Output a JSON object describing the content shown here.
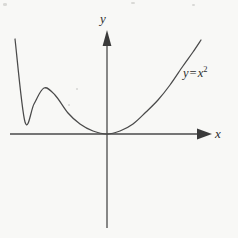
{
  "figure": {
    "background_color": "#f8f8f6",
    "ink_color": "#4a4a4a",
    "text_color": "#2e2e2e"
  },
  "labels": {
    "y_axis": "y",
    "x_axis": "x",
    "curve_lhs": "y",
    "curve_operator": "=",
    "curve_base": "x",
    "curve_exponent": "2"
  },
  "chart_data": {
    "type": "line",
    "title": "",
    "subtitle": "",
    "xlabel": "x",
    "ylabel": "y",
    "annotations": [
      "y = x²"
    ],
    "legend": [],
    "legend_position": "none",
    "grid": false,
    "axes": {
      "origin_px": [
        107,
        134
      ],
      "x_axis_from_px": [
        10,
        134
      ],
      "x_axis_to_px": [
        212,
        134
      ],
      "y_axis_from_px": [
        107,
        30
      ],
      "y_axis_to_px": [
        107,
        228
      ],
      "x_arrow": "right",
      "y_arrow": "up",
      "ticks": [],
      "tick_labels": []
    },
    "series": [
      {
        "name": "y = x²",
        "equation": "y = x^2",
        "coefficient_a": 0.0135,
        "x": [
          -6.8,
          -6.0,
          -5.0,
          -4.0,
          -3.0,
          -2.0,
          -1.0,
          0.0,
          1.0,
          2.0,
          3.0,
          4.0,
          5.0,
          6.0,
          6.9
        ],
        "values": [
          46.2,
          36.0,
          25.0,
          16.0,
          9.0,
          4.0,
          1.0,
          0.0,
          1.0,
          4.0,
          9.0,
          16.0,
          25.0,
          36.0,
          47.6
        ],
        "points_px": [
          [
            15,
            39
          ],
          [
            25,
            122
          ],
          [
            34,
            104
          ],
          [
            44,
            88
          ],
          [
            55,
            95
          ],
          [
            68,
            113
          ],
          [
            80,
            124
          ],
          [
            93,
            131
          ],
          [
            107,
            134
          ],
          [
            120,
            131
          ],
          [
            133,
            124
          ],
          [
            146,
            112
          ],
          [
            158,
            100
          ],
          [
            170,
            85
          ],
          [
            183,
            66
          ],
          [
            193,
            52
          ],
          [
            201,
            40
          ]
        ]
      }
    ],
    "xlim": [
      -6.8,
      6.9
    ],
    "ylim": [
      0,
      47.6
    ]
  }
}
